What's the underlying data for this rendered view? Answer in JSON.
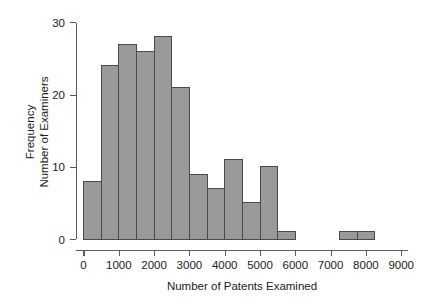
{
  "chart_data": {
    "type": "bar",
    "subtype": "histogram",
    "title": "",
    "xlabel": "Number of Patents Examined",
    "ylabel": "Frequency\nNumber of Examiners",
    "ylabel_lines": [
      "Frequency",
      "Number of Examiners"
    ],
    "xlim": [
      -250,
      9400
    ],
    "ylim": [
      0,
      31
    ],
    "bin_width": 500,
    "grid": false,
    "legend": false,
    "xticks": [
      0,
      1000,
      2000,
      3000,
      4000,
      5000,
      6000,
      7000,
      8000,
      9000
    ],
    "xtick_labels": [
      "0",
      "1000",
      "2000",
      "3000",
      "4000",
      "5000",
      "6000",
      "7000",
      "8000",
      "9000"
    ],
    "yticks": [
      0,
      10,
      20,
      30
    ],
    "ytick_labels": [
      "0",
      "10",
      "20",
      "30"
    ],
    "bin_edges": [
      0,
      500,
      1000,
      1500,
      2000,
      2500,
      3000,
      3500,
      4000,
      4500,
      5000,
      5500,
      6000
    ],
    "bins": [
      {
        "start": 0,
        "end": 500,
        "count": 8
      },
      {
        "start": 500,
        "end": 1000,
        "count": 24
      },
      {
        "start": 1000,
        "end": 1500,
        "count": 27
      },
      {
        "start": 1500,
        "end": 2000,
        "count": 26
      },
      {
        "start": 2000,
        "end": 2500,
        "count": 28
      },
      {
        "start": 2500,
        "end": 3000,
        "count": 21
      },
      {
        "start": 3000,
        "end": 3500,
        "count": 9
      },
      {
        "start": 3500,
        "end": 4000,
        "count": 7
      },
      {
        "start": 4000,
        "end": 4500,
        "count": 11
      },
      {
        "start": 4500,
        "end": 5000,
        "count": 5
      },
      {
        "start": 5000,
        "end": 5500,
        "count": 10
      },
      {
        "start": 5500,
        "end": 6000,
        "count": 1
      },
      {
        "start": 6000,
        "end": 6500,
        "count": 0
      },
      {
        "start": 6500,
        "end": 7000,
        "count": 0
      },
      {
        "start": 7250,
        "end": 7750,
        "count": 1
      },
      {
        "start": 7750,
        "end": 8250,
        "count": 1
      }
    ],
    "values": [
      8,
      24,
      27,
      26,
      28,
      21,
      9,
      7,
      11,
      5,
      10,
      1,
      0,
      0,
      1,
      1
    ],
    "colors": {
      "bar_fill": "#9a9a9a",
      "bar_stroke": "#4a4a4a",
      "axis": "#5a5a5a",
      "text": "#1a1a1a",
      "background": "#ffffff"
    }
  }
}
